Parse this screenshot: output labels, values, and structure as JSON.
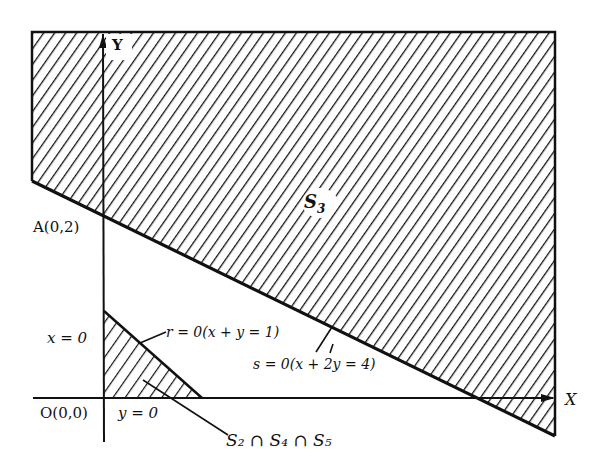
{
  "diagram": {
    "type": "linear-inequality-region",
    "regions": [
      {
        "name": "S3",
        "label": "S",
        "sub": "3",
        "description": "half-plane x + 2y >= 4 (hatched, above line s)"
      },
      {
        "name": "S2∩S4∩S5",
        "description": "triangle x>=0, y>=0, x+y<=1 (hatched)"
      }
    ],
    "labels": {
      "y_axis": "Y",
      "x_axis": "X",
      "point_A": "A(0,2)",
      "origin": "O(0,0)",
      "x_eq_0": "x = 0",
      "y_eq_0": "y = 0",
      "line_r": "r = 0(x + y = 1)",
      "line_s": "s = 0(x + 2y = 4)",
      "s3": "S",
      "s3_sub": "3",
      "intersection": "S₂ ∩ S₄ ∩ S₅"
    },
    "colors": {
      "ink": "#111111",
      "background": "#ffffff"
    }
  }
}
